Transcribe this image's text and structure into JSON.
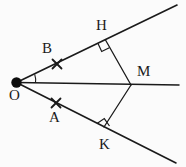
{
  "figure": {
    "type": "geometry-diagram",
    "background_color": "#fbfbfb",
    "stroke_color": "#1a1a1a",
    "label_color": "#1a1a1a"
  },
  "points": {
    "O": {
      "label": "O",
      "x": 16.5,
      "y": 82.5,
      "label_x": 9,
      "label_y": 88,
      "dot": true,
      "dot_radius": 5.2
    },
    "B": {
      "label": "B",
      "x": 57,
      "y": 64,
      "label_x": 42,
      "label_y": 41,
      "mark": "x-tick"
    },
    "A": {
      "label": "A",
      "x": 56,
      "y": 103,
      "label_x": 49,
      "label_y": 110,
      "mark": "x-tick"
    },
    "H": {
      "label": "H",
      "x": 105.5,
      "y": 40,
      "label_x": 96,
      "label_y": 18,
      "mark": "right-angle"
    },
    "K": {
      "label": "K",
      "x": 104,
      "y": 127,
      "label_x": 99,
      "label_y": 137,
      "mark": "right-angle"
    },
    "M": {
      "label": "M",
      "x": 131,
      "y": 85,
      "label_x": 137,
      "label_y": 64,
      "mark": "none"
    }
  },
  "segments": [
    {
      "name": "upper-ray-OH",
      "from": [
        16.5,
        82.5
      ],
      "to": [
        177,
        5
      ]
    },
    {
      "name": "lower-ray-OK",
      "from": [
        16.5,
        82.5
      ],
      "to": [
        176,
        163
      ]
    },
    {
      "name": "bisector-ray-OM",
      "from": [
        16.5,
        82.5
      ],
      "to": [
        179,
        85
      ]
    },
    {
      "name": "segment-MH",
      "from": [
        131,
        85
      ],
      "to": [
        105.5,
        40
      ]
    },
    {
      "name": "segment-MK",
      "from": [
        131,
        85
      ],
      "to": [
        104,
        127
      ]
    }
  ],
  "angle_arc": {
    "name": "angle-arc-at-O",
    "center": [
      16.5,
      82.5
    ],
    "radius": 19
  },
  "right_angle_markers": [
    {
      "name": "right-angle-at-H",
      "vertex": [
        105.5,
        40
      ],
      "size": 9
    },
    {
      "name": "right-angle-at-K",
      "vertex": [
        104,
        127
      ],
      "size": 9
    }
  ],
  "tick_marks": [
    {
      "name": "tick-at-B",
      "x": 57,
      "y": 64,
      "size": 4.5
    },
    {
      "name": "tick-at-A",
      "x": 56,
      "y": 103,
      "size": 4.5
    }
  ]
}
